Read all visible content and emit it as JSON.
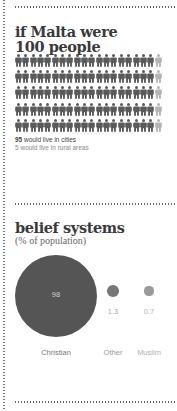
{
  "population": {
    "title_line1": "if Malta were",
    "title_line2": "100 people",
    "total": 100,
    "columns": 20,
    "rows": 5,
    "urban_color": "#5a5a5a",
    "rural_color": "#b4b4b4",
    "legend": [
      {
        "count": "95",
        "text": " would live in cities",
        "color": "#444444"
      },
      {
        "count": "5",
        "text": " would live in rural areas",
        "color": "#888888"
      }
    ]
  },
  "belief": {
    "title": "belief systems",
    "subtitle": "(% of population)"
  },
  "chart_data": [
    {
      "type": "pictogram",
      "title": "if Malta were 100 people",
      "categories": [
        "would live in cities",
        "would live in rural areas"
      ],
      "values": [
        95,
        5
      ],
      "grid": {
        "columns": 20,
        "rows": 5
      },
      "colors": [
        "#5a5a5a",
        "#b4b4b4"
      ]
    },
    {
      "type": "bubble",
      "title": "belief systems",
      "subtitle": "(% of population)",
      "categories": [
        "Christian",
        "Other",
        "Muslim"
      ],
      "values": [
        98,
        1.3,
        0.7
      ],
      "value_labels": [
        "98",
        "1.3",
        "0.7"
      ],
      "colors": [
        "#555555",
        "#777777",
        "#9a9a9a"
      ],
      "value_label_colors": [
        "#cfcfcf",
        "#aaaaaa",
        "#bbbbbb"
      ],
      "category_label_colors": [
        "#777777",
        "#999999",
        "#b0b0b0"
      ]
    }
  ]
}
